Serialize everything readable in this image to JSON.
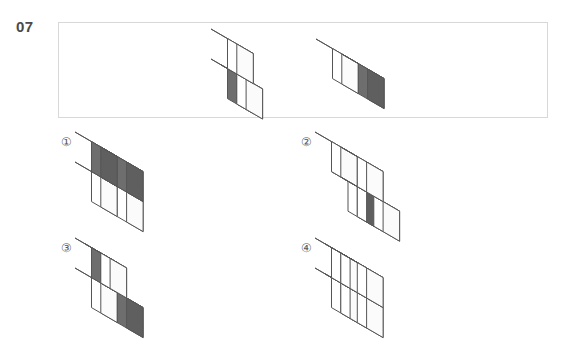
{
  "question": {
    "number": "07",
    "type": "3d-cube-mental-rotation"
  },
  "colors": {
    "cube_white_top": "#ffffff",
    "cube_white_left": "#ffffff",
    "cube_white_right": "#fbfbfb",
    "cube_dark_top": "#595959",
    "cube_dark_left": "#6e6e6e",
    "cube_dark_right": "#5f5f5f",
    "edge_stroke": "#555555",
    "box_border": "#d8d8d8",
    "label_text": "#5a5a5a",
    "number_text": "#4a4a4a",
    "background": "#ffffff"
  },
  "stimulus": {
    "figures": [
      {
        "name": "stimulus-figure-1",
        "cube_size": 30,
        "cubes": [
          {
            "gx": 0,
            "gy": 0,
            "gz": 0,
            "shade": "dark"
          },
          {
            "gx": 0,
            "gy": 0,
            "gz": 1,
            "shade": "white"
          },
          {
            "gx": 1,
            "gy": 1,
            "gz": 0,
            "shade": "white"
          }
        ]
      },
      {
        "name": "stimulus-figure-2",
        "cube_size": 30,
        "cubes": [
          {
            "gx": 0,
            "gy": 0,
            "gz": 0,
            "shade": "white"
          },
          {
            "gx": 1,
            "gy": 0,
            "gz": 0,
            "shade": "dark"
          }
        ]
      }
    ]
  },
  "options": [
    {
      "id": "option-1",
      "label": "①",
      "cube_size": 30,
      "cubes": [
        {
          "gx": 0,
          "gy": 0,
          "gz": 0,
          "shade": "white"
        },
        {
          "gx": 1,
          "gy": 0,
          "gz": 0,
          "shade": "white"
        },
        {
          "gx": 0,
          "gy": 0,
          "gz": 1,
          "shade": "dark"
        },
        {
          "gx": 1,
          "gy": 0,
          "gz": 1,
          "shade": "dark"
        }
      ]
    },
    {
      "id": "option-2",
      "label": "②",
      "cube_size": 30,
      "cubes": [
        {
          "gx": 0,
          "gy": 0,
          "gz": 0,
          "shade": "white"
        },
        {
          "gx": 1,
          "gy": 0,
          "gz": 0,
          "shade": "white"
        },
        {
          "gx": 0,
          "gy": 1,
          "gz": 1,
          "shade": "white"
        },
        {
          "gx": 1,
          "gy": 1,
          "gz": 1,
          "shade": "white"
        },
        {
          "gx": 1,
          "gy": 1,
          "gz": 0,
          "shade": "dark-right"
        }
      ]
    },
    {
      "id": "option-3",
      "label": "③",
      "cube_size": 30,
      "cubes": [
        {
          "gx": 0,
          "gy": 0,
          "gz": 0,
          "shade": "white"
        },
        {
          "gx": 1,
          "gy": 0,
          "gz": 0,
          "shade": "dark"
        },
        {
          "gx": 0,
          "gy": 0,
          "gz": 1,
          "shade": "dark"
        },
        {
          "gx": 1,
          "gy": 1,
          "gz": 1,
          "shade": "white"
        }
      ]
    },
    {
      "id": "option-4",
      "label": "④",
      "cube_size": 30,
      "cubes": [
        {
          "gx": 0,
          "gy": 0,
          "gz": 0,
          "shade": "white"
        },
        {
          "gx": 1,
          "gy": 0,
          "gz": 1,
          "shade": "white"
        },
        {
          "gx": 1,
          "gy": 0,
          "gz": 0,
          "shade": "white"
        },
        {
          "gx": 0,
          "gy": 0,
          "gz": 1,
          "shade": "dark-top"
        },
        {
          "gx": 1,
          "gy": 1,
          "gz": 1,
          "shade": "white"
        },
        {
          "gx": 1,
          "gy": 1,
          "gz": 0,
          "shade": "white"
        }
      ]
    }
  ]
}
